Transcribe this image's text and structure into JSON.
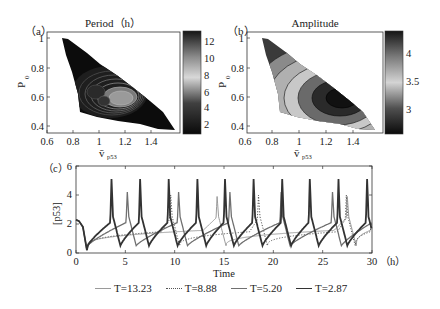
{
  "chart_data": [
    {
      "panel": "(a)",
      "type": "heatmap",
      "subtype": "filled-contour",
      "title": "Period（h）",
      "xlabel": "v̄ p53",
      "ylabel": "P0",
      "xlim": [
        0.6,
        1.6
      ],
      "ylim": [
        0.35,
        1.05
      ],
      "xticks": [
        "0.6",
        "0.8",
        "1",
        "1.2",
        "1.4"
      ],
      "yticks": [
        "0.4",
        "0.6",
        "0.8",
        "1"
      ],
      "colorbar": {
        "ticks": [
          "2",
          "4",
          "6",
          "8",
          "10",
          "12"
        ],
        "range": [
          1,
          13
        ],
        "colormap": "gray (dark-light-dark)"
      },
      "region": "triangular domain from (0.72,1.0) to (1.57,0.37), lower edge from (0.72,1.0) down to (0.95,0.4)",
      "features": "nested contour rings centered near (1.0,0.6) with high period (~10-12) at center, decreasing outward"
    },
    {
      "panel": "(b)",
      "type": "heatmap",
      "subtype": "filled-contour",
      "title": "Amplitude",
      "xlabel": "v̄ p53",
      "ylabel": "P0",
      "xlim": [
        0.6,
        1.6
      ],
      "ylim": [
        0.35,
        1.05
      ],
      "xticks": [
        "0.6",
        "0.8",
        "1",
        "1.2",
        "1.4"
      ],
      "yticks": [
        "0.4",
        "0.6",
        "0.8",
        "1"
      ],
      "colorbar": {
        "ticks": [
          "3",
          "3.5",
          "4"
        ],
        "range": [
          2.6,
          4.4
        ],
        "colormap": "gray (dark-light-dark)"
      },
      "region": "same triangular domain as (a)",
      "features": "nested elliptical contours, maximum amplitude (~4.3, darkest) near (1.3,0.57), decreasing toward upper-left"
    },
    {
      "panel": "(c)",
      "type": "line",
      "title": "",
      "xlabel": "Time",
      "x_unit_label": "（h）",
      "ylabel": "[p53]",
      "xlim": [
        0,
        30
      ],
      "ylim": [
        0,
        6
      ],
      "xticks": [
        "0",
        "5",
        "10",
        "15",
        "20",
        "25",
        "30"
      ],
      "yticks": [
        "0",
        "2",
        "4",
        "6"
      ],
      "grid": false,
      "legend_position": "bottom",
      "series": [
        {
          "name": "T=13.23",
          "style": "thin solid light gray",
          "period": 13.23,
          "peak_times": [
            14.3,
            27.5
          ],
          "peak_value": 3.9,
          "baseline": 1.3
        },
        {
          "name": "T=8.88",
          "style": "dotted",
          "period": 8.88,
          "peak_times": [
            9.6,
            18.5,
            27.4
          ],
          "peak_value": 4.0,
          "baseline": 1.2
        },
        {
          "name": "T=5.20",
          "style": "solid medium gray",
          "period": 5.2,
          "peak_times": [
            5.2,
            10.4,
            15.6,
            20.8,
            26.0
          ],
          "peak_value": 4.2,
          "trough": 0.5
        },
        {
          "name": "T=2.87",
          "style": "thick solid dark",
          "period": 2.87,
          "peak_times": [
            3.6,
            6.5,
            9.4,
            12.3,
            15.1,
            18.0,
            20.9,
            23.7,
            26.6,
            29.5
          ],
          "peak_value": 5.1,
          "trough": 0.5
        }
      ]
    }
  ],
  "panels": {
    "a": {
      "label": "（a）",
      "title": "Period（h）",
      "ylabel_main": "P",
      "ylabel_sub": "0",
      "xlabel_main": "v̄",
      "xlabel_sub": "p53",
      "xticks": [
        "0.6",
        "0.8",
        "1",
        "1.2",
        "1.4"
      ],
      "yticks": [
        "0.4",
        "0.6",
        "0.8",
        "1"
      ],
      "cbar_ticks": [
        "2",
        "4",
        "6",
        "8",
        "10",
        "12"
      ]
    },
    "b": {
      "label": "（b）",
      "title": "Amplitude",
      "ylabel_main": "P",
      "ylabel_sub": "0",
      "xlabel_main": "v̄",
      "xlabel_sub": "p53",
      "xticks": [
        "0.6",
        "0.8",
        "1",
        "1.2",
        "1.4"
      ],
      "yticks": [
        "0.4",
        "0.6",
        "0.8",
        "1"
      ],
      "cbar_ticks": [
        "3",
        "3.5",
        "4"
      ]
    },
    "c": {
      "label": "（c）",
      "ylabel": "[p53]",
      "xlabel": "Time",
      "x_unit": "（h）",
      "xticks": [
        "0",
        "5",
        "10",
        "15",
        "20",
        "25",
        "30"
      ],
      "yticks": [
        "0",
        "2",
        "4",
        "6"
      ]
    }
  },
  "legend": [
    {
      "label": "T=13.23",
      "color": "#9a9a9a",
      "dash": "solid",
      "width": 1
    },
    {
      "label": "T=8.88",
      "color": "#555555",
      "dash": "dotted",
      "width": 1
    },
    {
      "label": "T=5.20",
      "color": "#707070",
      "dash": "solid",
      "width": 1.3
    },
    {
      "label": "T=2.87",
      "color": "#333333",
      "dash": "solid",
      "width": 1.8
    }
  ]
}
